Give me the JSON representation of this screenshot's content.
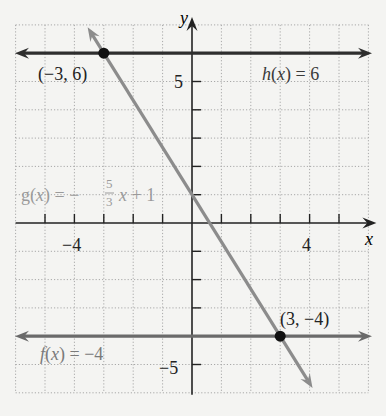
{
  "chart_data": {
    "type": "line",
    "title": "",
    "xlabel": "x",
    "ylabel": "y",
    "xlim": [
      -6,
      6
    ],
    "ylim": [
      -6,
      7
    ],
    "grid": true,
    "grid_style": "dotted",
    "x_tick_labels": [
      {
        "value": -4,
        "label": "−4"
      },
      {
        "value": 4,
        "label": "4"
      }
    ],
    "y_tick_labels": [
      {
        "value": 5,
        "label": "5"
      },
      {
        "value": -5,
        "label": "−5"
      }
    ],
    "series": [
      {
        "name": "h(x) = 6",
        "kind": "constant",
        "expression": "h(x) = 6",
        "slope": 0,
        "intercept": 6,
        "x_range": [
          -6,
          6
        ],
        "color": "#2e2e2e",
        "label_color": "#3a3a3a"
      },
      {
        "name": "g(x) = −5/3 x + 1",
        "kind": "linear",
        "expression": "g(x) = -(5/3)x + 1",
        "slope": -1.6667,
        "intercept": 1,
        "x_range": [
          -3.55,
          4.1
        ],
        "color": "#8c8c8c",
        "label_color": "#9a9a9a"
      },
      {
        "name": "f(x) = −4",
        "kind": "constant",
        "expression": "f(x) = -4",
        "slope": 0,
        "intercept": -4,
        "x_range": [
          -6,
          6
        ],
        "color": "#6a6a6a",
        "label_color": "#7a7a7a"
      }
    ],
    "points": [
      {
        "x": -3,
        "y": 6,
        "label": "(−3, 6)"
      },
      {
        "x": 3,
        "y": -4,
        "label": "(3, −4)"
      }
    ],
    "annotations": [
      {
        "text": "h(x) = 6",
        "series": "h"
      },
      {
        "text": "g(x) = −5/3 x + 1",
        "series": "g"
      },
      {
        "text": "f(x) = −4",
        "series": "f"
      }
    ]
  },
  "labels": {
    "axis_x": "x",
    "axis_y": "y",
    "tick_x_neg4": "−4",
    "tick_x_4": "4",
    "tick_y_5": "5",
    "tick_y_neg5": "−5",
    "point_a": "(−3, 6)",
    "point_b": "(3, −4)",
    "h_func": "h",
    "h_rest": " = 6",
    "g_func": "g",
    "g_minus": " = −",
    "g_num": "5",
    "g_den": "3",
    "g_rest": " + 1",
    "f_func": "f",
    "f_rest": " = −4",
    "x_var": "x",
    "paren_open": "(",
    "paren_close": ")"
  }
}
